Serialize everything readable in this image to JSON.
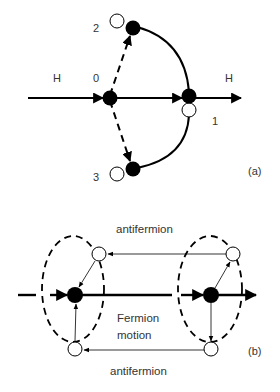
{
  "panel_a": {
    "tag": "(a)",
    "labels": {
      "h_in": "H",
      "h_out": "H",
      "node0": "0",
      "node1": "1",
      "node2": "2",
      "node3": "3"
    }
  },
  "panel_b": {
    "tag": "(b)",
    "top_label": "antifermion",
    "bottom_label": "antifermion",
    "center_line1": "Fermion",
    "center_line2": "motion"
  },
  "colors": {
    "stroke": "#000000",
    "text": "#333333",
    "open_fill": "#ffffff"
  }
}
